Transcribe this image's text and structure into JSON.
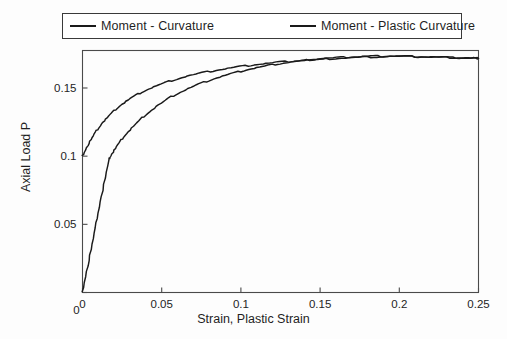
{
  "figure": {
    "background": "#fdfdfd",
    "line_color": "#1a1a1a",
    "axis_color": "#4a4a4a"
  },
  "legend": {
    "position": "top",
    "entries": [
      {
        "label": "Moment - Curvature",
        "swatch": "line-swatch-icon"
      },
      {
        "label": "Moment - Plastic Curvature",
        "swatch": "line-swatch-icon"
      }
    ]
  },
  "axes": {
    "xlabel": "Strain, Plastic Strain",
    "ylabel": "Axial Load P",
    "xticks": [
      "0",
      "0.05",
      "0.1",
      "0.15",
      "0.2",
      "0.25"
    ],
    "yticks": [
      "0",
      "0.05",
      "0.1",
      "0.15"
    ]
  },
  "chart_data": {
    "type": "line",
    "title": "",
    "xlabel": "Strain, Plastic Strain",
    "ylabel": "Axial Load P",
    "xlim": [
      0,
      0.25
    ],
    "ylim": [
      0,
      0.1775
    ],
    "xticks": [
      0,
      0.05,
      0.1,
      0.15,
      0.2,
      0.25
    ],
    "yticks": [
      0,
      0.05,
      0.1,
      0.15
    ],
    "grid": false,
    "legend_position": "top",
    "series": [
      {
        "name": "Moment - Curvature",
        "color": "#1a1a1a",
        "points": [
          [
            0.0,
            0.0
          ],
          [
            0.004,
            0.0235
          ],
          [
            0.008,
            0.047
          ],
          [
            0.012,
            0.0705
          ],
          [
            0.0165,
            0.097
          ],
          [
            0.018,
            0.1005
          ],
          [
            0.022,
            0.108
          ],
          [
            0.027,
            0.1155
          ],
          [
            0.033,
            0.123
          ],
          [
            0.04,
            0.1305
          ],
          [
            0.048,
            0.1375
          ],
          [
            0.056,
            0.1435
          ],
          [
            0.065,
            0.1487
          ],
          [
            0.075,
            0.1535
          ],
          [
            0.085,
            0.1575
          ],
          [
            0.095,
            0.1608
          ],
          [
            0.105,
            0.1637
          ],
          [
            0.115,
            0.166
          ],
          [
            0.125,
            0.168
          ],
          [
            0.135,
            0.1695
          ],
          [
            0.145,
            0.1708
          ],
          [
            0.155,
            0.1718
          ],
          [
            0.165,
            0.1725
          ],
          [
            0.175,
            0.173
          ],
          [
            0.185,
            0.1733
          ],
          [
            0.195,
            0.1734
          ],
          [
            0.205,
            0.1732
          ],
          [
            0.215,
            0.1729
          ],
          [
            0.225,
            0.1726
          ],
          [
            0.235,
            0.1722
          ],
          [
            0.245,
            0.1719
          ],
          [
            0.25,
            0.1717
          ]
        ]
      },
      {
        "name": "Moment - Plastic Curvature",
        "color": "#1a1a1a",
        "points": [
          [
            0.0,
            0.1
          ],
          [
            0.004,
            0.1095
          ],
          [
            0.008,
            0.1172
          ],
          [
            0.013,
            0.125
          ],
          [
            0.018,
            0.1312
          ],
          [
            0.024,
            0.1373
          ],
          [
            0.031,
            0.1429
          ],
          [
            0.039,
            0.1479
          ],
          [
            0.048,
            0.1522
          ],
          [
            0.058,
            0.1561
          ],
          [
            0.068,
            0.1592
          ],
          [
            0.079,
            0.1619
          ],
          [
            0.09,
            0.1641
          ],
          [
            0.101,
            0.1659
          ],
          [
            0.112,
            0.1675
          ],
          [
            0.124,
            0.1689
          ],
          [
            0.136,
            0.17
          ],
          [
            0.148,
            0.1709
          ],
          [
            0.16,
            0.1717
          ],
          [
            0.172,
            0.1723
          ],
          [
            0.184,
            0.1728
          ],
          [
            0.196,
            0.1731
          ],
          [
            0.208,
            0.173
          ],
          [
            0.22,
            0.1727
          ],
          [
            0.232,
            0.1723
          ],
          [
            0.244,
            0.172
          ],
          [
            0.25,
            0.1718
          ]
        ]
      }
    ]
  }
}
